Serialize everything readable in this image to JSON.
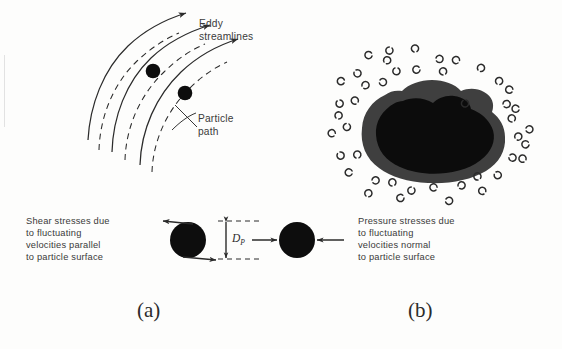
{
  "figure": {
    "title_a": "(a)",
    "title_b": "(b)",
    "background_color": "#fdfdfc",
    "ink_color": "#2b2b2b"
  },
  "panel_a": {
    "labels": {
      "eddy_streamlines_line1": "Eddy",
      "eddy_streamlines_line2": "streamlines",
      "particle_path_line1": "Particle",
      "particle_path_line2": "path"
    },
    "streamline_count": 3,
    "particle_count": 2,
    "dashed_path_count": 3
  },
  "panel_b": {
    "description": "dark irregular blob surrounded by small eddy curl symbols",
    "blob_core_color": "#101010",
    "blob_halo_color": "#3c3c3c",
    "curl_count": 44
  },
  "bottom_left": {
    "text_line1": "Shear stresses due",
    "text_line2": "to fluctuating",
    "text_line3": "velocities parallel",
    "text_line4": "to particle surface",
    "arrow_top_direction": "left",
    "arrow_bottom_direction": "right"
  },
  "bottom_right": {
    "text_line1": "Pressure stresses due",
    "text_line2": "to fluctuating",
    "text_line3": "velocities normal",
    "text_line4": "to particle surface",
    "arrow_left_direction": "right",
    "arrow_right_direction": "left"
  },
  "dimension": {
    "symbol": "D",
    "subscript": "P"
  }
}
